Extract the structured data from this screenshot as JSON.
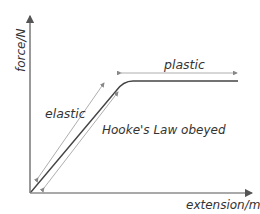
{
  "diagram": {
    "axes": {
      "y_label": "force/N",
      "x_label": "extension/m"
    },
    "regions": {
      "plastic": "plastic",
      "elastic": "elastic",
      "hooke": "Hooke's Law obeyed"
    },
    "colors": {
      "axis": "#555555",
      "curve": "#444444",
      "annotation_arrow": "#999999",
      "text": "#333333"
    }
  }
}
